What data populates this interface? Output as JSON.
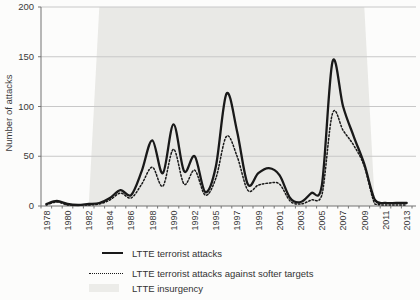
{
  "figure": {
    "background": "#fcfcfb"
  },
  "colors": {
    "line": "#191919",
    "band": "#e9e9e6",
    "gridline": "#c8c8c8",
    "axis": "#737373",
    "text": "#3a3a3a"
  },
  "chart_data": {
    "type": "line",
    "title": "",
    "xlabel": "",
    "ylabel": "Number of attacks",
    "ylim": [
      0,
      200
    ],
    "yticks": [
      0,
      50,
      100,
      150,
      200
    ],
    "grid": true,
    "legend_position": "bottom-left",
    "x_note": "category axis skips 1993; every second category labeled",
    "categories": [
      1978,
      1979,
      1980,
      1981,
      1982,
      1983,
      1984,
      1985,
      1986,
      1987,
      1988,
      1989,
      1990,
      1991,
      1992,
      1994,
      1995,
      1996,
      1997,
      1998,
      1999,
      2000,
      2001,
      2002,
      2003,
      2004,
      2005,
      2006,
      2007,
      2008,
      2009,
      2010,
      2011,
      2012,
      2013
    ],
    "x_tick_labels": [
      "1978",
      "1980",
      "1982",
      "1984",
      "1986",
      "1988",
      "1990",
      "1992",
      "1995",
      "1997",
      "1999",
      "2001",
      "2003",
      "2005",
      "2007",
      "2009",
      "2011",
      "2013"
    ],
    "series": [
      {
        "name": "LTTE terrorist attacks",
        "style": "solid",
        "color": "#191919",
        "values": [
          2,
          5,
          2,
          1,
          2,
          3,
          8,
          16,
          11,
          35,
          66,
          33,
          82,
          35,
          50,
          14,
          40,
          113,
          75,
          22,
          33,
          38,
          31,
          8,
          4,
          13,
          21,
          145,
          100,
          70,
          42,
          6,
          3,
          3,
          3
        ]
      },
      {
        "name": "LTTE terrorist attacks against softer targets",
        "style": "dotted",
        "color": "#191919",
        "values": [
          1,
          4,
          1,
          1,
          1,
          2,
          6,
          13,
          8,
          22,
          39,
          20,
          57,
          22,
          36,
          11,
          28,
          70,
          50,
          16,
          21,
          23,
          22,
          5,
          2,
          6,
          11,
          93,
          76,
          61,
          40,
          2,
          1,
          1,
          1
        ]
      },
      {
        "name": "LTTE insurgency",
        "style": "area-band",
        "color": "#e9e9e6",
        "band_start_year": 1983,
        "band_end_year": 2009,
        "band_value": 200
      }
    ]
  },
  "legend": {
    "items": [
      {
        "label": "LTTE terrorist attacks"
      },
      {
        "label": "LTTE terrorist attacks against softer targets"
      },
      {
        "label": "LTTE insurgency"
      }
    ]
  }
}
